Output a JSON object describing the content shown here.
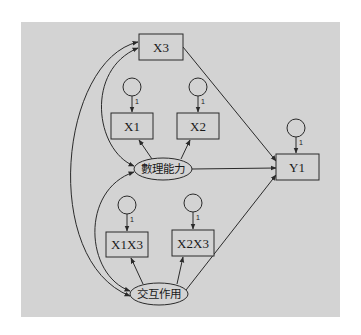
{
  "diagram": {
    "type": "structural-equation-model",
    "colors": {
      "panel": "#d3d3d3",
      "stroke": "#2a2a2a",
      "background": "#ffffff"
    },
    "observed": {
      "x3": "X3",
      "x1": "X1",
      "x2": "X2",
      "y1": "Y1",
      "x1x3": "X1X3",
      "x2x3": "X2X3"
    },
    "latent": {
      "math_ability": "數理能力",
      "interaction": "交互作用"
    },
    "error_weights": {
      "x1": "1",
      "x2": "1",
      "y1": "1",
      "x1x3": "1",
      "x2x3": "1"
    },
    "paths": [
      {
        "from": "數理能力",
        "to": "X1",
        "kind": "loading"
      },
      {
        "from": "數理能力",
        "to": "X2",
        "kind": "loading"
      },
      {
        "from": "交互作用",
        "to": "X1X3",
        "kind": "loading"
      },
      {
        "from": "交互作用",
        "to": "X2X3",
        "kind": "loading"
      },
      {
        "from": "X3",
        "to": "Y1",
        "kind": "regression"
      },
      {
        "from": "數理能力",
        "to": "Y1",
        "kind": "regression"
      },
      {
        "from": "交互作用",
        "to": "Y1",
        "kind": "regression"
      },
      {
        "from": "X3",
        "to": "數理能力",
        "kind": "covariance"
      },
      {
        "from": "X3",
        "to": "交互作用",
        "kind": "covariance"
      },
      {
        "from": "數理能力",
        "to": "交互作用",
        "kind": "covariance"
      }
    ]
  }
}
